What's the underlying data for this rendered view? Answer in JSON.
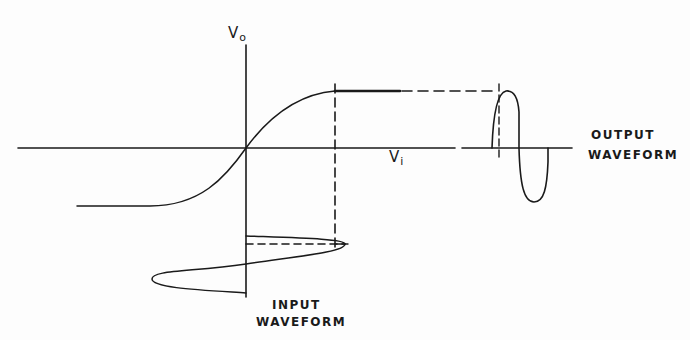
{
  "diagram": {
    "type": "transfer-characteristic",
    "axes": {
      "y_label": {
        "main": "V",
        "sub": "o"
      },
      "x_label": {
        "main": "V",
        "sub": "i"
      }
    },
    "labels": {
      "output_line1": "OUTPUT",
      "output_line2": "WAVEFORM",
      "input_line1": "INPUT",
      "input_line2": "WAVEFORM"
    },
    "colors": {
      "ink": "#1a1a1a",
      "background": "#fdfdfd"
    }
  }
}
